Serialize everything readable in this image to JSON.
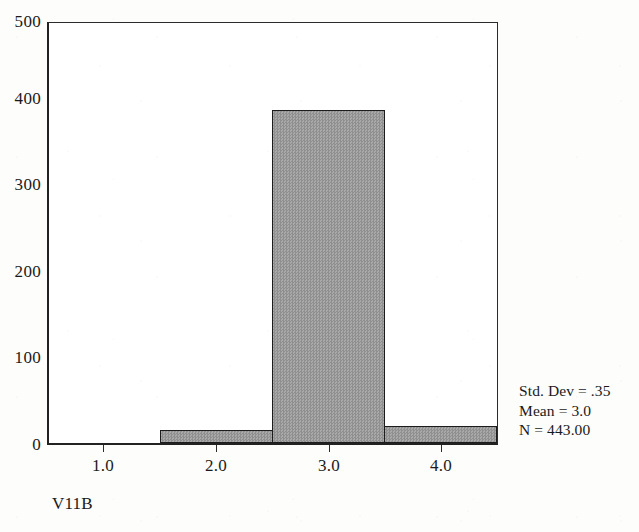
{
  "chart_data": {
    "type": "bar",
    "subtype": "histogram",
    "title": "",
    "subtitle": "",
    "xlabel": "V11B",
    "ylabel": "",
    "categories": [
      "1.0",
      "2.0",
      "3.0",
      "4.0"
    ],
    "x": [
      1.0,
      2.0,
      3.0,
      4.0
    ],
    "values": [
      0,
      16,
      397,
      20
    ],
    "bin_edges": [
      0.5,
      1.5,
      2.5,
      3.5,
      4.5
    ],
    "bin_width": 1.0,
    "xlim": [
      0.5,
      4.5
    ],
    "ylim": [
      0,
      500
    ],
    "ytick_values": [
      0,
      100,
      200,
      300,
      400,
      500
    ],
    "ytick_labels": [
      "0",
      "100",
      "200",
      "300",
      "400",
      "500"
    ],
    "xtick_values": [
      1.0,
      2.0,
      3.0,
      4.0
    ],
    "xtick_labels": [
      "1.0",
      "2.0",
      "3.0",
      "4.0"
    ],
    "grid": false,
    "legend": false,
    "legend_position": "none",
    "bar_fill_color": "#9d9d9d",
    "bar_edge_color": "#1c1c1c",
    "axis_color": "#222222",
    "background_color": "#ffffff",
    "annotations": {
      "std_dev": "Std. Dev = .35",
      "mean": "Mean = 3.0",
      "n": "N = 443.00"
    },
    "stats": {
      "std_dev_value": 0.35,
      "mean_value": 3.0,
      "n_value": 443.0
    }
  },
  "axis": {
    "x_title": "V11B",
    "y_ticks": [
      {
        "label": "500"
      },
      {
        "label": "400"
      },
      {
        "label": "300"
      },
      {
        "label": "200"
      },
      {
        "label": "100"
      },
      {
        "label": "0"
      }
    ],
    "x_ticks": [
      {
        "label": "1.0"
      },
      {
        "label": "2.0"
      },
      {
        "label": "3.0"
      },
      {
        "label": "4.0"
      }
    ]
  },
  "stats_panel": {
    "line1": "Std. Dev = .35",
    "line2": "Mean = 3.0",
    "line3": "N = 443.00"
  }
}
